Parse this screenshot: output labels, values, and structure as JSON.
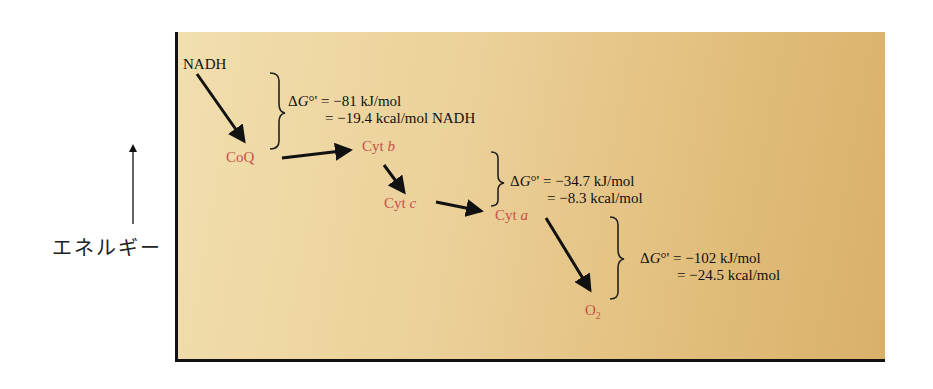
{
  "diagram": {
    "axis": {
      "label": "エネルギー",
      "direction": "up"
    },
    "nodes": {
      "nadh": "NADH",
      "coq": "CoQ",
      "cytb_prefix": "Cyt ",
      "cytb_suffix": "b",
      "cytc_prefix": "Cyt ",
      "cytc_suffix": "c",
      "cyta_prefix": "Cyt ",
      "cyta_suffix": "a",
      "o2_base": "O",
      "o2_sub": "2"
    },
    "colors": {
      "carrier": "#c8504a",
      "text": "#111111",
      "panel_light": "#f1dfae",
      "panel_dark": "#d9b06a"
    },
    "energy_steps": [
      {
        "symbol_delta": "Δ",
        "symbol_g": "G",
        "symbol_rest": "°' = ",
        "line1": "−81 kJ/mol",
        "line2": "= −19.4 kcal/mol NADH"
      },
      {
        "symbol_delta": "Δ",
        "symbol_g": "G",
        "symbol_rest": "°' = ",
        "line1": "−34.7 kJ/mol",
        "line2": "= −8.3 kcal/mol"
      },
      {
        "symbol_delta": "Δ",
        "symbol_g": "G",
        "symbol_rest": "°' = ",
        "line1": "−102 kJ/mol",
        "line2": "= −24.5 kcal/mol"
      }
    ]
  }
}
